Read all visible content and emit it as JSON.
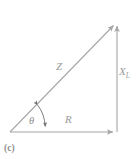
{
  "figure": {
    "caption": "(c)",
    "type": "impedance-triangle",
    "stroke_color": "#a6a6a6",
    "text_color": "#9a9a9a",
    "background_color": "#ffffff"
  },
  "labels": {
    "hypotenuse": "Z",
    "vertical_leg": "X",
    "vertical_leg_subscript": "L",
    "horizontal_leg": "R",
    "angle": "θ"
  },
  "geometry": {
    "origin": {
      "x": 10,
      "y": 132
    },
    "bottom_right": {
      "x": 117,
      "y": 132
    },
    "top_right": {
      "x": 117,
      "y": 22
    },
    "arc_radius": 38
  }
}
